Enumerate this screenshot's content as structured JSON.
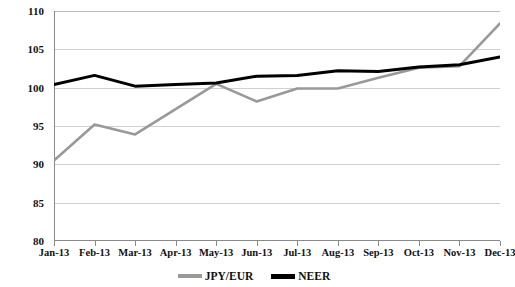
{
  "chart_data": {
    "type": "line",
    "title": "",
    "subtitle": "",
    "xlabel": "",
    "ylabel": "",
    "ylim": [
      80,
      110
    ],
    "yticks": [
      80,
      85,
      90,
      95,
      100,
      105,
      110
    ],
    "grid": true,
    "legend_position": "bottom-center",
    "categories": [
      "Jan-13",
      "Feb-13",
      "Mar-13",
      "Apr-13",
      "May-13",
      "Jun-13",
      "Jul-13",
      "Aug-13",
      "Sep-13",
      "Oct-13",
      "Nov-13",
      "Dec-13"
    ],
    "series": [
      {
        "name": "JPY/EUR",
        "color": "#999999",
        "values": [
          90.5,
          95.2,
          93.9,
          97.2,
          100.5,
          98.2,
          99.9,
          99.9,
          101.3,
          102.6,
          102.8,
          108.4
        ]
      },
      {
        "name": "NEER",
        "color": "#000000",
        "values": [
          100.4,
          101.6,
          100.2,
          100.4,
          100.6,
          101.5,
          101.6,
          102.2,
          102.1,
          102.7,
          103.0,
          104.0
        ]
      }
    ]
  },
  "legend": {
    "items": [
      {
        "label": "JPY/EUR",
        "color": "#999999"
      },
      {
        "label": "NEER",
        "color": "#000000"
      }
    ]
  },
  "axis": {
    "y_tick_labels": [
      "110",
      "105",
      "100",
      "95",
      "90",
      "85",
      "80"
    ],
    "x_tick_labels": [
      "Jan-13",
      "Feb-13",
      "Mar-13",
      "Apr-13",
      "May-13",
      "Jun-13",
      "Jul-13",
      "Aug-13",
      "Sep-13",
      "Oct-13",
      "Nov-13",
      "Dec-13"
    ]
  }
}
